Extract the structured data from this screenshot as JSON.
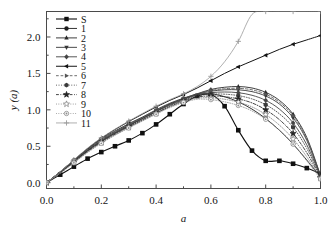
{
  "chart_data": {
    "type": "line",
    "title": "",
    "xlabel": "a",
    "ylabel": "y (a)",
    "xlim": [
      0.0,
      1.0
    ],
    "ylim": [
      -0.08,
      2.35
    ],
    "grid": false,
    "legend_position": "top-left",
    "xticks": [
      "0.0",
      "0.2",
      "0.4",
      "0.6",
      "0.8",
      "1.0"
    ],
    "xtick_values": [
      0.0,
      0.2,
      0.4,
      0.6,
      0.8,
      1.0
    ],
    "yticks": [
      "0.0",
      "0.5",
      "1.0",
      "1.5",
      "2.0"
    ],
    "ytick_values": [
      0.0,
      0.5,
      1.0,
      1.5,
      2.0
    ],
    "x": [
      0.0,
      0.05,
      0.1,
      0.15,
      0.2,
      0.25,
      0.3,
      0.35,
      0.4,
      0.45,
      0.5,
      0.55,
      0.6,
      0.65,
      0.7,
      0.75,
      0.8,
      0.85,
      0.9,
      0.95,
      1.0
    ],
    "series": [
      {
        "name": "S",
        "marker": "square-filled",
        "color": "#101010",
        "linestyle": "solid",
        "linewidth": 1.1,
        "values": [
          0.0,
          0.11,
          0.22,
          0.33,
          0.42,
          0.5,
          0.58,
          0.68,
          0.8,
          0.94,
          1.08,
          1.19,
          1.21,
          1.05,
          0.72,
          0.44,
          0.3,
          0.3,
          0.26,
          0.2,
          0.12
        ]
      },
      {
        "name": "1",
        "marker": "circle-filled",
        "color": "#1c1c1c",
        "linestyle": "solid",
        "linewidth": 0.9,
        "values": [
          0.0,
          0.14,
          0.29,
          0.44,
          0.57,
          0.68,
          0.78,
          0.88,
          0.98,
          1.08,
          1.15,
          1.21,
          1.22,
          1.18,
          1.11,
          1.01,
          0.88,
          0.72,
          0.53,
          0.31,
          0.08
        ]
      },
      {
        "name": "2",
        "marker": "triangle-up",
        "color": "#2a2a2a",
        "linestyle": "solid",
        "linewidth": 0.9,
        "values": [
          0.0,
          0.15,
          0.31,
          0.46,
          0.6,
          0.71,
          0.81,
          0.9,
          1.0,
          1.09,
          1.16,
          1.22,
          1.28,
          1.31,
          1.32,
          1.3,
          1.24,
          1.13,
          0.94,
          0.62,
          0.1
        ]
      },
      {
        "name": "3",
        "marker": "triangle-down",
        "color": "#383838",
        "linestyle": "solid",
        "linewidth": 0.9,
        "values": [
          0.0,
          0.145,
          0.3,
          0.45,
          0.585,
          0.695,
          0.795,
          0.89,
          0.985,
          1.075,
          1.15,
          1.215,
          1.255,
          1.275,
          1.275,
          1.25,
          1.19,
          1.08,
          0.89,
          0.58,
          0.09
        ]
      },
      {
        "name": "4",
        "marker": "diamond",
        "color": "#454545",
        "linestyle": "solid",
        "linewidth": 0.9,
        "values": [
          0.0,
          0.142,
          0.295,
          0.445,
          0.575,
          0.685,
          0.785,
          0.88,
          0.975,
          1.065,
          1.14,
          1.205,
          1.235,
          1.245,
          1.235,
          1.2,
          1.13,
          1.01,
          0.82,
          0.52,
          0.085
        ]
      },
      {
        "name": "5",
        "marker": "triangle-left",
        "color": "#141414",
        "linestyle": "solid",
        "linewidth": 1.0,
        "values": [
          0.0,
          0.15,
          0.31,
          0.47,
          0.61,
          0.73,
          0.84,
          0.94,
          1.04,
          1.13,
          1.21,
          1.3,
          1.4,
          1.5,
          1.59,
          1.67,
          1.75,
          1.83,
          1.9,
          1.96,
          2.02
        ]
      },
      {
        "name": "6",
        "marker": "triangle-right",
        "color": "#555555",
        "linestyle": "dashed",
        "linewidth": 0.85,
        "values": [
          0.0,
          0.147,
          0.305,
          0.455,
          0.59,
          0.7,
          0.8,
          0.895,
          0.99,
          1.08,
          1.155,
          1.22,
          1.265,
          1.29,
          1.295,
          1.275,
          1.215,
          1.105,
          0.92,
          0.6,
          0.095
        ]
      },
      {
        "name": "7",
        "marker": "hexagon",
        "color": "#3a3a3a",
        "linestyle": "dotted",
        "linewidth": 0.85,
        "values": [
          0.0,
          0.138,
          0.288,
          0.435,
          0.565,
          0.675,
          0.775,
          0.87,
          0.965,
          1.055,
          1.13,
          1.19,
          1.215,
          1.215,
          1.195,
          1.15,
          1.07,
          0.945,
          0.76,
          0.47,
          0.075
        ]
      },
      {
        "name": "8",
        "marker": "star-filled",
        "color": "#252525",
        "linestyle": "dash-dot",
        "linewidth": 0.85,
        "values": [
          0.0,
          0.135,
          0.282,
          0.428,
          0.555,
          0.665,
          0.765,
          0.86,
          0.955,
          1.045,
          1.12,
          1.175,
          1.19,
          1.18,
          1.15,
          1.095,
          1.0,
          0.865,
          0.675,
          0.41,
          0.07
        ]
      },
      {
        "name": "9",
        "marker": "star-open",
        "color": "#787878",
        "linestyle": "dotted",
        "linewidth": 0.8,
        "values": [
          0.0,
          0.132,
          0.277,
          0.42,
          0.548,
          0.658,
          0.758,
          0.852,
          0.948,
          1.038,
          1.11,
          1.16,
          1.165,
          1.145,
          1.105,
          1.04,
          0.935,
          0.79,
          0.6,
          0.355,
          0.06
        ]
      },
      {
        "name": "10",
        "marker": "circle-dot",
        "color": "#8a8a8a",
        "linestyle": "dotted",
        "linewidth": 0.8,
        "values": [
          0.0,
          0.129,
          0.272,
          0.414,
          0.54,
          0.65,
          0.75,
          0.845,
          0.94,
          1.03,
          1.1,
          1.145,
          1.14,
          1.11,
          1.06,
          0.985,
          0.87,
          0.72,
          0.53,
          0.3,
          0.05
        ]
      },
      {
        "name": "11",
        "marker": "plus-open",
        "color": "#9a9a9a",
        "linestyle": "solid",
        "linewidth": 0.8,
        "values": [
          0.0,
          0.152,
          0.315,
          0.475,
          0.615,
          0.735,
          0.845,
          0.95,
          1.05,
          1.14,
          1.22,
          1.32,
          1.46,
          1.66,
          1.94,
          2.31,
          2.35,
          2.35,
          2.35,
          2.35,
          2.35
        ]
      }
    ]
  },
  "legend": {
    "entries": [
      {
        "label": "S"
      },
      {
        "label": "1"
      },
      {
        "label": "2"
      },
      {
        "label": "3"
      },
      {
        "label": "4"
      },
      {
        "label": "5"
      },
      {
        "label": "6"
      },
      {
        "label": "7"
      },
      {
        "label": "8"
      },
      {
        "label": "9"
      },
      {
        "label": "10"
      },
      {
        "label": "11"
      }
    ]
  },
  "axes": {
    "x_title": "a",
    "y_title_main": "y",
    "y_title_paren_open": "(",
    "y_title_arg": "a",
    "y_title_paren_close": ")"
  }
}
